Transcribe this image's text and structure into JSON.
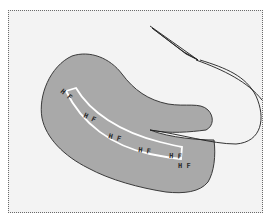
{
  "figure": {
    "type": "surgical-illustration",
    "border_style": "dotted",
    "colors": {
      "background": "#f3f3f3",
      "flap_fill": "#a9a9a9",
      "flap_stroke": "#3a3a3a",
      "strip_stroke": "#ffffff",
      "suture": "#1e1e1e",
      "frame": "#6a6a6a"
    },
    "markers": [
      {
        "label": "H F",
        "x": 60,
        "y": 92,
        "rotate": 40
      },
      {
        "label": "H F",
        "x": 83,
        "y": 117,
        "rotate": 25
      },
      {
        "label": "H F",
        "x": 108,
        "y": 138,
        "rotate": 15
      },
      {
        "label": "H F",
        "x": 138,
        "y": 152,
        "rotate": 8
      },
      {
        "label": "H F",
        "x": 169,
        "y": 158,
        "rotate": 3
      },
      {
        "label": "H F",
        "x": 178,
        "y": 168,
        "rotate": 0
      }
    ],
    "elements": {
      "tissue_flap": "tissue-flap",
      "incision_strip": "incision-strip",
      "suture_thread": "suture-thread",
      "needle": "needle-icon"
    }
  }
}
